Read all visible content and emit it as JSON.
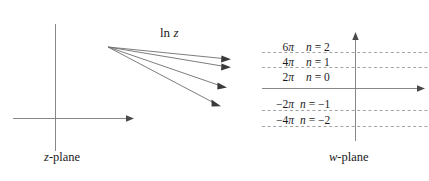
{
  "figure": {
    "title_map_label": "ln z",
    "left_plane_label": "z-plane",
    "right_plane_label": "w-plane",
    "left_plane_label_var": "z",
    "left_plane_label_rest": "-plane",
    "right_plane_label_var": "w",
    "right_plane_label_rest": "-plane",
    "map_label_fn": "ln",
    "map_label_var": "z",
    "line_color": "#6e6e6e",
    "text_color": "#1a1a1a",
    "background": "#ffffff"
  },
  "w_plane": {
    "branch_rows": [
      {
        "tick": "6π",
        "n_label": "n = 2",
        "n_value": "2"
      },
      {
        "tick": "4π",
        "n_label": "n = 1",
        "n_value": "1"
      },
      {
        "tick": "2π",
        "n_label": "n = 0",
        "n_value": "0"
      },
      {
        "tick": "−2π",
        "n_label": "n = −1",
        "n_value": "-1"
      },
      {
        "tick": "−4π",
        "n_label": "n = −2",
        "n_value": "-2"
      }
    ]
  },
  "z_plane": {
    "ray_count": "4"
  }
}
